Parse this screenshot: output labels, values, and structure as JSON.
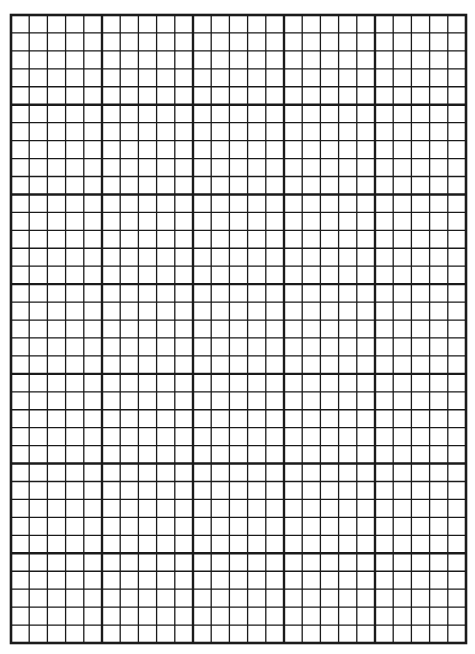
{
  "sheet": {
    "type": "graph-paper",
    "left": 11,
    "top": 15,
    "width": 455,
    "height": 628,
    "major_cols": 5,
    "major_rows": 7,
    "minor_per_major": 5,
    "line_color": "#1a1a1a",
    "minor_stroke": 1.3,
    "major_stroke": 2.4,
    "border_stroke": 2.6
  }
}
